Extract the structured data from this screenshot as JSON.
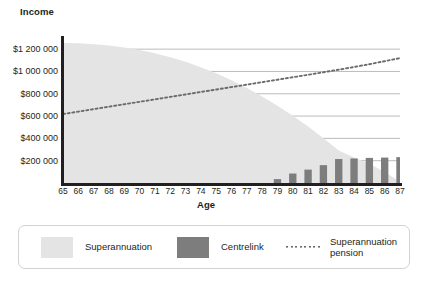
{
  "chart_data": {
    "type": "area",
    "title": "",
    "ylabel": "Income",
    "xlabel": "Age",
    "categories": [
      65,
      66,
      67,
      68,
      69,
      70,
      71,
      72,
      73,
      74,
      75,
      76,
      77,
      78,
      79,
      80,
      81,
      82,
      83,
      84,
      85,
      86,
      87
    ],
    "ylim": [
      0,
      1300000
    ],
    "yticks": [
      200000,
      400000,
      600000,
      800000,
      1000000,
      1200000
    ],
    "ytick_labels": [
      "$200 000",
      "$400 000",
      "$600 000",
      "$800 000",
      "$1 000 000",
      "$1 200 000"
    ],
    "grid": true,
    "legend_position": "bottom",
    "series": [
      {
        "name": "Superannuation",
        "type": "area",
        "color": "#e4e4e4",
        "values": [
          1255000,
          1252000,
          1245000,
          1232000,
          1215000,
          1192000,
          1163000,
          1128000,
          1086000,
          1038000,
          983000,
          921000,
          852000,
          776000,
          693000,
          603000,
          506000,
          402000,
          291000,
          228000,
          172000,
          98000,
          12000
        ]
      },
      {
        "name": "Centrelink",
        "type": "bar",
        "color": "#7d7d7d",
        "values": [
          0,
          0,
          0,
          0,
          0,
          0,
          0,
          0,
          0,
          0,
          0,
          0,
          0,
          0,
          35000,
          85000,
          120000,
          160000,
          215000,
          220000,
          225000,
          228000,
          232000
        ]
      },
      {
        "name": "Superannuation pension",
        "type": "line",
        "style": "dotted",
        "color": "#6b6b6b",
        "values": [
          618000,
          640000,
          662000,
          684000,
          706000,
          728000,
          750000,
          772000,
          794000,
          816000,
          838000,
          860000,
          882000,
          904000,
          926000,
          948000,
          970000,
          993000,
          1016000,
          1040000,
          1065000,
          1092000,
          1120000
        ]
      }
    ],
    "legend": [
      {
        "label": "Superannuation",
        "swatch": "light-gray-square"
      },
      {
        "label": "Centrelink",
        "swatch": "dark-gray-square"
      },
      {
        "label": "Superannuation pension",
        "swatch": "dotted-line"
      }
    ]
  }
}
